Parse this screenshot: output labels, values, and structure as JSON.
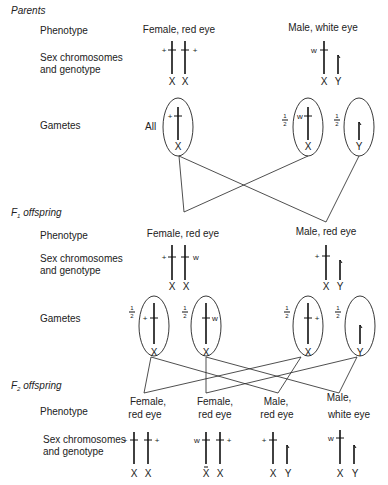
{
  "sections": {
    "parents": "Parents",
    "f1_prefix": "F",
    "f1_sub": "1",
    "f1_suffix": " offspring",
    "f2_prefix": "F",
    "f2_sub": "2",
    "f2_suffix": " offspring"
  },
  "row_labels": {
    "phenotype": "Phenotype",
    "sex_chromosomes_line1": "Sex chromosomes",
    "sex_chromosomes_line2": "and genotype",
    "gametes": "Gametes"
  },
  "parents": {
    "female_phenotype": "Female, red eye",
    "male_phenotype": "Male, white eye",
    "female_alleles": [
      "+",
      "+"
    ],
    "female_chromosomes": [
      "X",
      "X"
    ],
    "male_alleles": [
      "w"
    ],
    "male_chromosomes": [
      "X",
      "Y"
    ],
    "gametes": {
      "female_label": "All",
      "female_allele": "+",
      "female_chromosome": "X",
      "male_x_fraction": "1/2",
      "male_x_allele": "w",
      "male_x_chromosome": "X",
      "male_y_fraction": "1/2",
      "male_y_chromosome": "Y"
    }
  },
  "f1": {
    "female_phenotype": "Female, red eye",
    "male_phenotype": "Male, red eye",
    "female_alleles": [
      "+",
      "w"
    ],
    "female_chromosomes": [
      "X",
      "X"
    ],
    "male_alleles": [
      "+"
    ],
    "male_chromosomes": [
      "X",
      "Y"
    ],
    "gametes": [
      {
        "fraction": "1/2",
        "allele": "+",
        "chromosome": "X"
      },
      {
        "fraction": "1/2",
        "allele": "w",
        "chromosome": "X"
      },
      {
        "fraction": "1/2",
        "allele": "+",
        "chromosome": "X"
      },
      {
        "fraction": "1/2",
        "allele": "",
        "chromosome": "Y"
      }
    ]
  },
  "f2": {
    "offspring": [
      {
        "phenotype_line1": "Female,",
        "phenotype_line2": "red eye",
        "alleles": [
          "+",
          "+"
        ],
        "chromosomes": [
          "X",
          "X"
        ]
      },
      {
        "phenotype_line1": "Female,",
        "phenotype_line2": "red eye",
        "alleles": [
          "w",
          "+"
        ],
        "chromosomes": [
          "X",
          "X"
        ]
      },
      {
        "phenotype_line1": "Male,",
        "phenotype_line2": "red eye",
        "alleles": [
          "+"
        ],
        "chromosomes": [
          "X",
          "Y"
        ]
      },
      {
        "phenotype_line1": "Male,",
        "phenotype_line2": "white eye",
        "alleles": [
          "w"
        ],
        "chromosomes": [
          "X",
          "Y"
        ]
      }
    ]
  }
}
